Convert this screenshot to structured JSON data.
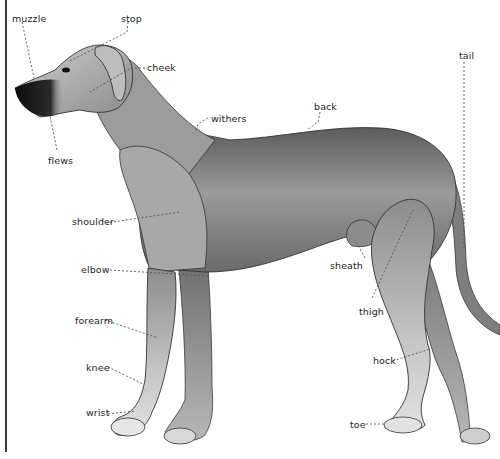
{
  "diagram": {
    "colors": {
      "body": "#8a8a8a",
      "body_dark": "#3d3d3d",
      "body_light": "#d6d6d6",
      "nose": "#111111",
      "leader": "#555555"
    },
    "labels": [
      {
        "id": "muzzle",
        "text": "muzzle",
        "x": 12,
        "y": 13
      },
      {
        "id": "stop",
        "text": "stop",
        "x": 121,
        "y": 13
      },
      {
        "id": "cheek",
        "text": "cheek",
        "x": 147,
        "y": 64
      },
      {
        "id": "withers",
        "text": "withers",
        "x": 211,
        "y": 115
      },
      {
        "id": "back",
        "text": "back",
        "x": 314,
        "y": 103
      },
      {
        "id": "tail",
        "text": "tail",
        "x": 459,
        "y": 52
      },
      {
        "id": "flews",
        "text": "flews",
        "x": 48,
        "y": 157
      },
      {
        "id": "shoulder",
        "text": "shoulder",
        "x": 72,
        "y": 218
      },
      {
        "id": "elbow",
        "text": "elbow",
        "x": 81,
        "y": 266
      },
      {
        "id": "sheath",
        "text": "sheath",
        "x": 330,
        "y": 262
      },
      {
        "id": "thigh",
        "text": "thigh",
        "x": 359,
        "y": 308
      },
      {
        "id": "forearm",
        "text": "forearm",
        "x": 75,
        "y": 317
      },
      {
        "id": "knee",
        "text": "knee",
        "x": 86,
        "y": 364
      },
      {
        "id": "hock",
        "text": "hock",
        "x": 373,
        "y": 355
      },
      {
        "id": "wrist",
        "text": "wrist",
        "x": 86,
        "y": 407
      },
      {
        "id": "toe",
        "text": "toe",
        "x": 350,
        "y": 419
      }
    ]
  }
}
